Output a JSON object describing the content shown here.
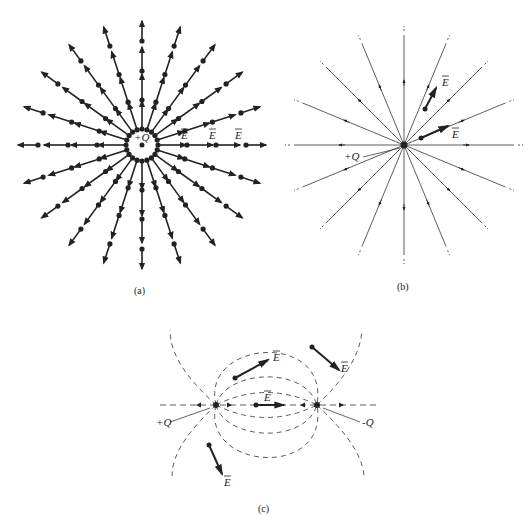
{
  "figure": {
    "panels": [
      {
        "id": "a",
        "caption": "(a)",
        "description": "Field vectors of a positive point charge drawn at sample points along radial lines",
        "charge_label": "+Q",
        "field_labels": [
          "E",
          "E",
          "E"
        ],
        "num_radial_lines": 20
      },
      {
        "id": "b",
        "caption": "(b)",
        "description": "Electric flux lines radiating outward from a positive point charge",
        "charge_label": "+Q",
        "field_labels": [
          "E",
          "E"
        ],
        "num_radial_lines": 16
      },
      {
        "id": "c",
        "caption": "(c)",
        "description": "Dashed flux lines of an electric dipole from +Q to -Q with sample field vectors",
        "positive_charge_label": "+Q",
        "negative_charge_label": "-Q",
        "field_labels": [
          "E",
          "E",
          "E",
          "E"
        ]
      }
    ]
  }
}
